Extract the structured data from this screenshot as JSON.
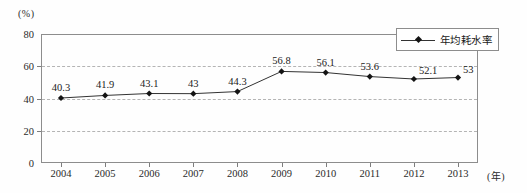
{
  "chart_data": {
    "type": "line",
    "title": "",
    "subtitle": "",
    "xlabel": "(年)",
    "ylabel": "(%)",
    "x": [
      2004,
      2005,
      2006,
      2007,
      2008,
      2009,
      2010,
      2011,
      2012,
      2013
    ],
    "categories": [
      "2004",
      "2005",
      "2006",
      "2007",
      "2008",
      "2009",
      "2010",
      "2011",
      "2012",
      "2013"
    ],
    "values": [
      40.3,
      41.9,
      43.1,
      43,
      44.3,
      56.8,
      56.1,
      53.6,
      52.1,
      53
    ],
    "point_labels": [
      "40.3",
      "41.9",
      "43.1",
      "43",
      "44.3",
      "56.8",
      "56.1",
      "53.6",
      "52.1",
      "53"
    ],
    "series": [
      {
        "name": "年均耗水率",
        "values": [
          40.3,
          41.9,
          43.1,
          43,
          44.3,
          56.8,
          56.1,
          53.6,
          52.1,
          53
        ],
        "marker": "diamond",
        "color": "#141414"
      }
    ],
    "ylim": [
      0,
      80
    ],
    "yticks": [
      0,
      20,
      40,
      60,
      80
    ],
    "ytick_labels": [
      "0",
      "20",
      "40",
      "60",
      "80"
    ],
    "gridlines": [
      20,
      40,
      60
    ],
    "grid": true,
    "grid_style": "dashed",
    "legend": {
      "position": "top-right-inside",
      "entries": [
        "年均耗水率"
      ]
    },
    "axis_color": "#8d8d8d",
    "grid_color": "#b4b4b4",
    "series_color": "#333333",
    "marker_color": "#141414",
    "label_color": "#222222"
  }
}
